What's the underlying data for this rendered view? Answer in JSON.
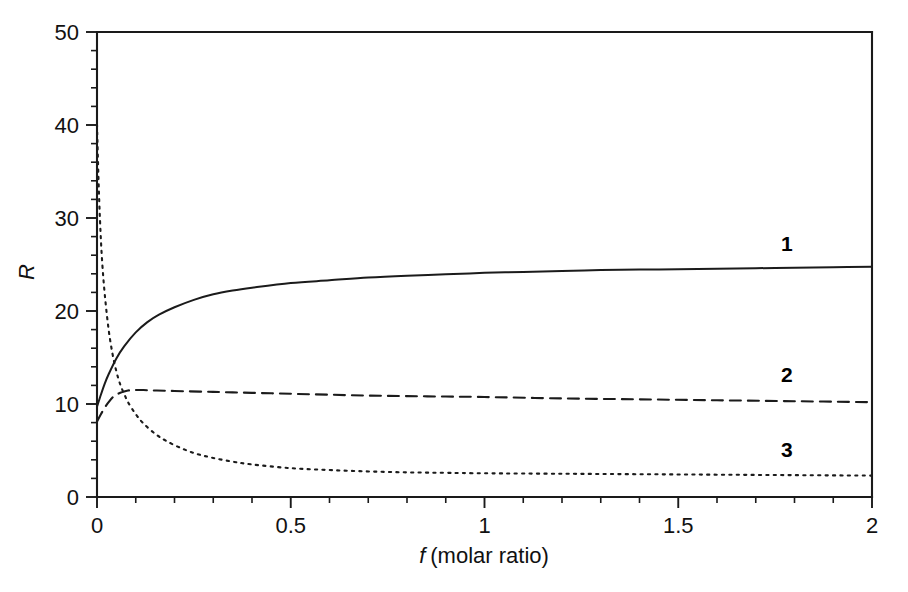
{
  "figure": {
    "title": "",
    "background_color": "#ffffff",
    "line_color": "#1b1b1b"
  },
  "axes": {
    "x_title_italic": "f",
    "x_title_rest": "(molar ratio)",
    "y_title": "R",
    "x_ticks": [
      "0",
      "0.5",
      "1",
      "1.5",
      "2"
    ],
    "y_ticks": [
      "0",
      "10",
      "20",
      "30",
      "40",
      "50"
    ]
  },
  "curve_labels": {
    "one": "1",
    "two": "2",
    "three": "3"
  },
  "chart_data": {
    "type": "line",
    "title": "",
    "subtitle": "",
    "xlabel": "f (molar ratio)",
    "ylabel": "R",
    "xlim": [
      0,
      2
    ],
    "ylim": [
      0,
      50
    ],
    "x_major_ticks": [
      0,
      0.5,
      1,
      1.5,
      2
    ],
    "y_major_ticks": [
      0,
      10,
      20,
      30,
      40,
      50
    ],
    "x_minor_tick_step": 0.1,
    "y_minor_tick_step": 2,
    "grid": false,
    "legend_position": "inline-curve-labels",
    "annotations": [
      {
        "text": "1",
        "x": 1.78,
        "y": 26.4
      },
      {
        "text": "2",
        "x": 1.78,
        "y": 12.4
      },
      {
        "text": "3",
        "x": 1.78,
        "y": 4.3
      }
    ],
    "series": [
      {
        "name": "1",
        "label": "1",
        "style": "solid",
        "x": [
          0,
          0.01,
          0.02,
          0.03,
          0.05,
          0.07,
          0.1,
          0.13,
          0.16,
          0.2,
          0.25,
          0.3,
          0.35,
          0.4,
          0.5,
          0.6,
          0.7,
          0.8,
          0.9,
          1.0,
          1.1,
          1.2,
          1.3,
          1.4,
          1.5,
          1.6,
          1.7,
          1.8,
          1.9,
          2.0
        ],
        "y": [
          9.7,
          11.0,
          12.2,
          13.2,
          14.9,
          16.2,
          17.7,
          18.8,
          19.6,
          20.4,
          21.2,
          21.8,
          22.2,
          22.5,
          23.0,
          23.3,
          23.6,
          23.8,
          23.95,
          24.1,
          24.2,
          24.3,
          24.4,
          24.45,
          24.5,
          24.55,
          24.6,
          24.65,
          24.7,
          24.75
        ]
      },
      {
        "name": "2",
        "label": "2",
        "style": "dashed",
        "x": [
          0,
          0.01,
          0.02,
          0.03,
          0.04,
          0.05,
          0.06,
          0.07,
          0.08,
          0.09,
          0.1,
          0.12,
          0.15,
          0.2,
          0.3,
          0.4,
          0.5,
          0.6,
          0.7,
          0.8,
          0.9,
          1.0,
          1.2,
          1.4,
          1.6,
          1.8,
          2.0
        ],
        "y": [
          8.1,
          8.9,
          9.6,
          10.2,
          10.7,
          11.0,
          11.2,
          11.35,
          11.45,
          11.5,
          11.5,
          11.5,
          11.45,
          11.4,
          11.3,
          11.2,
          11.1,
          11.0,
          10.9,
          10.85,
          10.8,
          10.75,
          10.6,
          10.5,
          10.4,
          10.3,
          10.2
        ]
      },
      {
        "name": "3",
        "label": "3",
        "style": "dotted",
        "x": [
          0,
          0.004,
          0.008,
          0.013,
          0.02,
          0.03,
          0.04,
          0.05,
          0.06,
          0.07,
          0.08,
          0.1,
          0.12,
          0.15,
          0.18,
          0.22,
          0.26,
          0.3,
          0.35,
          0.4,
          0.5,
          0.6,
          0.7,
          0.8,
          0.9,
          1.0,
          1.2,
          1.4,
          1.6,
          1.8,
          2.0
        ],
        "y": [
          40.0,
          34.0,
          29.5,
          25.5,
          21.8,
          18.0,
          15.4,
          13.5,
          12.1,
          11.1,
          10.2,
          8.9,
          7.9,
          6.8,
          6.0,
          5.2,
          4.6,
          4.2,
          3.8,
          3.5,
          3.1,
          2.9,
          2.75,
          2.65,
          2.6,
          2.55,
          2.5,
          2.45,
          2.4,
          2.35,
          2.3
        ]
      }
    ]
  },
  "geometry": {
    "plot_left": 97,
    "plot_right": 872,
    "plot_top": 32,
    "plot_bottom": 497
  }
}
